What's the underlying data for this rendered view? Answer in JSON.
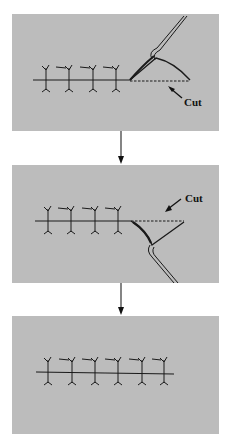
{
  "diagram": {
    "type": "procedure-steps",
    "background": "#ffffff",
    "panel_color": "#bcbcbc",
    "line_color": "#1a1a1a",
    "steps": [
      {
        "id": "step-1",
        "description": "Running suture with four tied stitches; needle holder above the incision end, cut along dashed line",
        "stitch_count": 4,
        "cut_label": "Cut",
        "instrument": "needle-holder-above"
      },
      {
        "id": "step-2",
        "description": "Running suture with four tied stitches; needle holder below the incision end, cut along dashed line",
        "stitch_count": 4,
        "cut_label": "Cut",
        "instrument": "needle-holder-below"
      },
      {
        "id": "step-3",
        "description": "Completed suture line with six tied stitches",
        "stitch_count": 6
      }
    ],
    "arrows": [
      {
        "from": "step-1",
        "to": "step-2"
      },
      {
        "from": "step-2",
        "to": "step-3"
      }
    ]
  }
}
